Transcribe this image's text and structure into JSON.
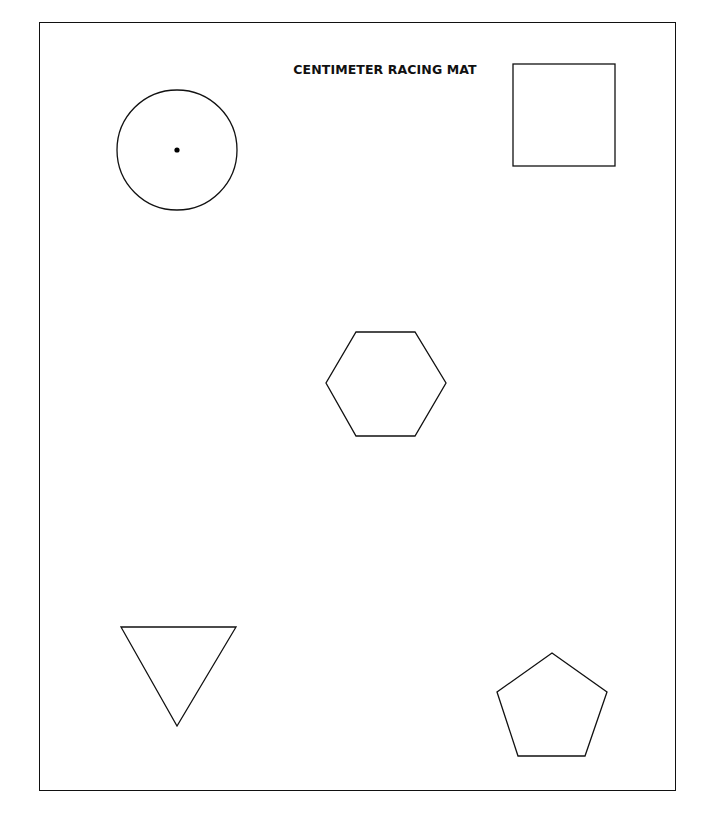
{
  "page": {
    "title": "CENTIMETER RACING MAT",
    "stroke_color": "#111111",
    "background": "#ffffff"
  },
  "shapes": [
    {
      "type": "circle",
      "name": "circle",
      "cx": 177,
      "cy": 150,
      "r": 60,
      "center_dot": true
    },
    {
      "type": "square",
      "name": "square",
      "x": 513,
      "y": 64,
      "w": 102,
      "h": 102
    },
    {
      "type": "hexagon",
      "name": "hexagon",
      "points": "356,332 415,332 446,383 415,436 356,436 326,383"
    },
    {
      "type": "triangle",
      "name": "triangle",
      "points": "121,627 236,627 177,726"
    },
    {
      "type": "pentagon",
      "name": "pentagon",
      "points": "552,653 607,692 585,756 518,756 497,692"
    }
  ]
}
